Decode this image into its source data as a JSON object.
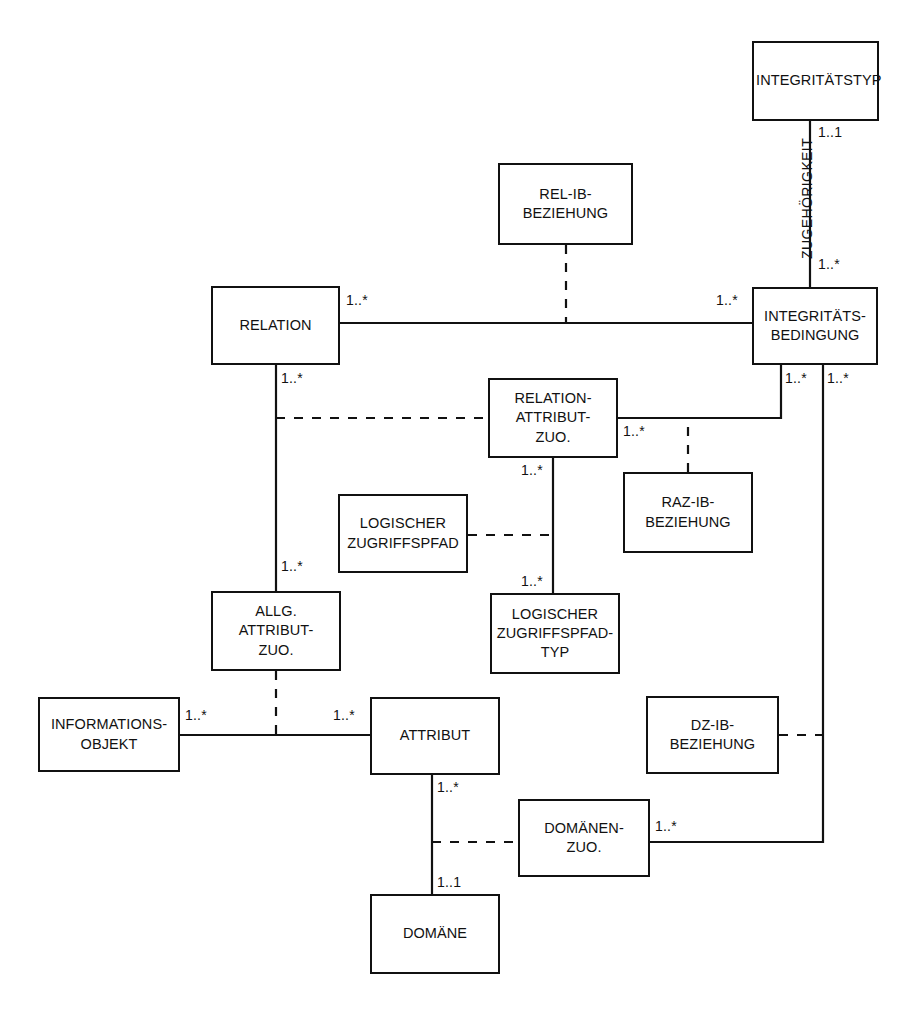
{
  "diagram": {
    "type": "entity-relationship-diagram",
    "notation": "UML-Klassendiagramm / ER-Diagramm",
    "line_color": "#111111",
    "fill_color": "#ffffff",
    "entities": [
      {
        "id": "integritaetstyp",
        "label": "INTEGRITÄTSTYP",
        "lines": [
          "INTEGRITÄTSTYP"
        ],
        "x": 752,
        "y": 41,
        "w": 127,
        "h": 80
      },
      {
        "id": "rel_ib_beziehung",
        "label": "REL-IB-BEZIEHUNG",
        "lines": [
          "REL-IB-",
          "BEZIEHUNG"
        ],
        "x": 498,
        "y": 163,
        "w": 135,
        "h": 82
      },
      {
        "id": "relation",
        "label": "RELATION",
        "lines": [
          "RELATION"
        ],
        "x": 211,
        "y": 286,
        "w": 129,
        "h": 79
      },
      {
        "id": "integritaetsbedingung",
        "label": "INTEGRITÄTS-BEDINGUNG",
        "lines": [
          "INTEGRITÄTS-",
          "BEDINGUNG"
        ],
        "x": 752,
        "y": 287,
        "w": 126,
        "h": 78
      },
      {
        "id": "relation_attribut_zuo",
        "label": "RELATION-ATTRIBUT-ZUO.",
        "lines": [
          "RELATION-",
          "ATTRIBUT-",
          "ZUO."
        ],
        "x": 488,
        "y": 378,
        "w": 130,
        "h": 80
      },
      {
        "id": "raz_ib_beziehung",
        "label": "RAZ-IB-BEZIEHUNG",
        "lines": [
          "RAZ-IB-",
          "BEZIEHUNG"
        ],
        "x": 623,
        "y": 472,
        "w": 130,
        "h": 81
      },
      {
        "id": "logischer_zugriffspfad",
        "label": "LOGISCHER ZUGRIFFSPFAD",
        "lines": [
          "LOGISCHER",
          "ZUGRIFFSPFAD"
        ],
        "x": 338,
        "y": 494,
        "w": 130,
        "h": 79
      },
      {
        "id": "allg_attribut_zuo",
        "label": "ALLG. ATTRIBUT-ZUO.",
        "lines": [
          "ALLG.",
          "ATTRIBUT-",
          "ZUO."
        ],
        "x": 211,
        "y": 591,
        "w": 130,
        "h": 80
      },
      {
        "id": "log_zugriffspfad_typ",
        "label": "LOGISCHER ZUGRIFFSPFAD-TYP",
        "lines": [
          "LOGISCHER",
          "ZUGRIFFSPFAD-",
          "TYP"
        ],
        "x": 490,
        "y": 593,
        "w": 130,
        "h": 81
      },
      {
        "id": "informationsobjekt",
        "label": "INFORMATIONS-OBJEKT",
        "lines": [
          "INFORMATIONS-",
          "OBJEKT"
        ],
        "x": 38,
        "y": 697,
        "w": 142,
        "h": 75
      },
      {
        "id": "attribut",
        "label": "ATTRIBUT",
        "lines": [
          "ATTRIBUT"
        ],
        "x": 370,
        "y": 697,
        "w": 130,
        "h": 78
      },
      {
        "id": "dz_ib_beziehung",
        "label": "DZ-IB-BEZIEHUNG",
        "lines": [
          "DZ-IB-",
          "BEZIEHUNG"
        ],
        "x": 646,
        "y": 696,
        "w": 133,
        "h": 78
      },
      {
        "id": "domaenen_zuo",
        "label": "DOMÄNEN-ZUO.",
        "lines": [
          "DOMÄNEN-",
          "ZUO."
        ],
        "x": 518,
        "y": 799,
        "w": 132,
        "h": 78
      },
      {
        "id": "domaene",
        "label": "DOMÄNE",
        "lines": [
          "DOMÄNE"
        ],
        "x": 370,
        "y": 894,
        "w": 130,
        "h": 80
      }
    ],
    "association_labels": [
      {
        "id": "zugehoerigkeit",
        "text": "ZUGEHÖRIGKEIT",
        "x": 807,
        "y": 203,
        "rotated": true
      }
    ],
    "cardinalities": [
      {
        "id": "card-integritaetstyp-down",
        "text": "1..1",
        "x": 818,
        "y": 124
      },
      {
        "id": "card-integritaetsbedingung-up",
        "text": "1..*",
        "x": 818,
        "y": 258
      },
      {
        "id": "card-relation-right",
        "text": "1..*",
        "x": 346,
        "y": 292
      },
      {
        "id": "card-integritaetsbedingung-left",
        "text": "1..*",
        "x": 716,
        "y": 292
      },
      {
        "id": "card-relation-down",
        "text": "1..*",
        "x": 281,
        "y": 370
      },
      {
        "id": "card-integritaetsbedingung-bl",
        "text": "1..*",
        "x": 781,
        "y": 370
      },
      {
        "id": "card-integritaetsbedingung-br",
        "text": "1..*",
        "x": 823,
        "y": 370
      },
      {
        "id": "card-raz-right",
        "text": "1..*",
        "x": 623,
        "y": 424
      },
      {
        "id": "card-raz-down",
        "text": "1..*",
        "x": 522,
        "y": 463
      },
      {
        "id": "card-allg-attribut-up",
        "text": "1..*",
        "x": 281,
        "y": 560
      },
      {
        "id": "card-lzpt-up",
        "text": "1..*",
        "x": 522,
        "y": 575
      },
      {
        "id": "card-informationsobjekt-right",
        "text": "1..*",
        "x": 185,
        "y": 709
      },
      {
        "id": "card-attribut-left",
        "text": "1..*",
        "x": 333,
        "y": 709
      },
      {
        "id": "card-attribut-down",
        "text": "1..*",
        "x": 437,
        "y": 781
      },
      {
        "id": "card-domaenen-zuo-right",
        "text": "1..*",
        "x": 655,
        "y": 820
      },
      {
        "id": "card-domaene-up",
        "text": "1..1",
        "x": 437,
        "y": 878
      }
    ],
    "relationships": [
      {
        "id": "rel-integritaetstyp-integritaetsbedingung",
        "from": "integritaetstyp",
        "to": "integritaetsbedingung",
        "style": "solid",
        "label": "ZUGEHÖRIGKEIT",
        "from_card": "1..1",
        "to_card": "1..*"
      },
      {
        "id": "rel-relation-integritaetsbedingung",
        "from": "relation",
        "to": "integritaetsbedingung",
        "style": "solid",
        "from_card": "1..*",
        "to_card": "1..*"
      },
      {
        "id": "rel-relibbeziehung-assoc",
        "from": "rel_ib_beziehung",
        "to": "rel-relation-integritaetsbedingung",
        "style": "dashed"
      },
      {
        "id": "rel-relation-allgattributzuo",
        "from": "relation",
        "to": "allg_attribut_zuo",
        "style": "solid",
        "from_card": "1..*",
        "to_card": "1..*"
      },
      {
        "id": "rel-relationattributzuo-assoc",
        "from": "relation_attribut_zuo",
        "to": "rel-relation-allgattributzuo",
        "style": "dashed"
      },
      {
        "id": "rel-relationattributzuo-integritaetsbedingung",
        "from": "relation_attribut_zuo",
        "to": "integritaetsbedingung",
        "style": "solid",
        "from_card": "1..*",
        "to_card": "1..*"
      },
      {
        "id": "rel-razibbeziehung-assoc",
        "from": "raz_ib_beziehung",
        "to": "rel-relationattributzuo-integritaetsbedingung",
        "style": "dashed"
      },
      {
        "id": "rel-relationattributzuo-lzptyp",
        "from": "relation_attribut_zuo",
        "to": "log_zugriffspfad_typ",
        "style": "solid",
        "from_card": "1..*",
        "to_card": "1..*"
      },
      {
        "id": "rel-logischerzugriffspfad-assoc",
        "from": "logischer_zugriffspfad",
        "to": "rel-relationattributzuo-lzptyp",
        "style": "dashed"
      },
      {
        "id": "rel-informationsobjekt-attribut",
        "from": "informationsobjekt",
        "to": "attribut",
        "style": "solid",
        "from_card": "1..*",
        "to_card": "1..*"
      },
      {
        "id": "rel-allgattributzuo-assoc",
        "from": "allg_attribut_zuo",
        "to": "rel-informationsobjekt-attribut",
        "style": "dashed"
      },
      {
        "id": "rel-attribut-domaene",
        "from": "attribut",
        "to": "domaene",
        "style": "solid",
        "from_card": "1..*",
        "to_card": "1..1"
      },
      {
        "id": "rel-domaenenzuo-assoc",
        "from": "domaenen_zuo",
        "to": "rel-attribut-domaene",
        "style": "dashed"
      },
      {
        "id": "rel-domaenenzuo-integritaetsbedingung",
        "from": "domaenen_zuo",
        "to": "integritaetsbedingung",
        "style": "solid",
        "from_card": "1..*",
        "to_card": "1..*"
      },
      {
        "id": "rel-dzibbeziehung-assoc",
        "from": "dz_ib_beziehung",
        "to": "rel-domaenenzuo-integritaetsbedingung",
        "style": "dashed"
      }
    ]
  }
}
